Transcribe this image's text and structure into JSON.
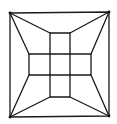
{
  "diagram": {
    "title": "",
    "stroke_color": "#1a1a1a",
    "background": "#ffffff",
    "outer_square": {
      "x1": 10,
      "y1": 13,
      "x2": 109,
      "y2": 117
    },
    "corners": {
      "top_left": [
        10,
        13
      ],
      "top_right": [
        109,
        12
      ],
      "bottom_left": [
        10,
        117
      ],
      "bottom_right": [
        109,
        116
      ]
    },
    "cross": {
      "vertical_bar": {
        "x1": 50,
        "x2": 70,
        "y1": 33,
        "y2": 97
      },
      "horizontal_bar": {
        "x1": 29,
        "x2": 91,
        "y1": 54,
        "y2": 75
      }
    },
    "connectors": [
      {
        "from": "top_left",
        "to": [
          50,
          33
        ]
      },
      {
        "from": "top_left",
        "to": [
          29,
          54
        ]
      },
      {
        "from": "top_right",
        "to": [
          70,
          33
        ]
      },
      {
        "from": "top_right",
        "to": [
          91,
          54
        ]
      },
      {
        "from": "bottom_left",
        "to": [
          29,
          75
        ]
      },
      {
        "from": "bottom_left",
        "to": [
          50,
          97
        ]
      },
      {
        "from": "bottom_right",
        "to": [
          91,
          75
        ]
      },
      {
        "from": "bottom_right",
        "to": [
          70,
          97
        ]
      }
    ]
  }
}
